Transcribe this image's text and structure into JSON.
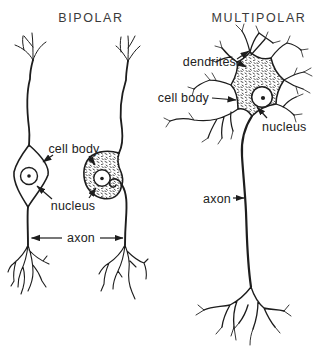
{
  "figure": {
    "background": "#ffffff",
    "ink_color": "#1d1d1d",
    "bipolar": {
      "title": "BIPOLAR",
      "labels": {
        "cell_body": "cell body",
        "nucleus": "nucleus",
        "axon": "axon"
      }
    },
    "multipolar": {
      "title": "MULTIPOLAR",
      "labels": {
        "dendrites": "dendrites",
        "cell_body": "cell body",
        "nucleus": "nucleus",
        "axon": "axon"
      }
    }
  }
}
